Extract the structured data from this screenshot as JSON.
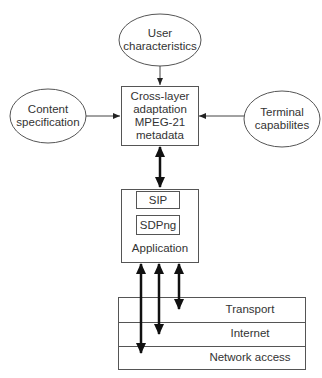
{
  "nodes": {
    "user": {
      "line1": "User",
      "line2": "characteristics"
    },
    "content": {
      "line1": "Content",
      "line2": "specification"
    },
    "terminal": {
      "line1": "Terminal",
      "line2": "capabilites"
    },
    "crosslayer": {
      "line1": "Cross-layer",
      "line2": "adaptation",
      "line3": "MPEG-21",
      "line4": "metadata"
    },
    "application": {
      "sip": "SIP",
      "sdpng": "SDPng",
      "label": "Application"
    }
  },
  "layers": [
    "Transport",
    "Internet",
    "Network access"
  ],
  "colors": {
    "stroke": "#555555",
    "arrow": "#111111",
    "text": "#333333"
  }
}
